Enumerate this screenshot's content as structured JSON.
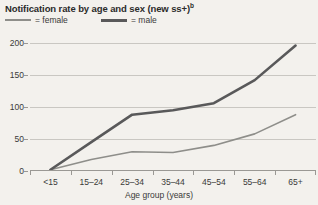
{
  "chart_data": {
    "type": "line",
    "title": "Notification rate by age and sex (new ss+)",
    "title_superscript": "b",
    "xlabel": "Age group (years)",
    "ylabel": "",
    "categories": [
      "<15",
      "15–24",
      "25–34",
      "35–44",
      "45–54",
      "55–64",
      "65+"
    ],
    "ylim": [
      0,
      200
    ],
    "yticks": [
      0,
      50,
      100,
      150,
      200
    ],
    "grid": true,
    "legend_position": "top-left",
    "series": [
      {
        "name": "female",
        "color": "#8e8e8a",
        "width": 1.6,
        "values": [
          2,
          18,
          30,
          29,
          40,
          58,
          88
        ]
      },
      {
        "name": "male",
        "color": "#59595a",
        "width": 2.6,
        "values": [
          2,
          45,
          88,
          95,
          106,
          142,
          196
        ]
      }
    ]
  },
  "legend": {
    "female_label": "= female",
    "male_label": "= male"
  }
}
